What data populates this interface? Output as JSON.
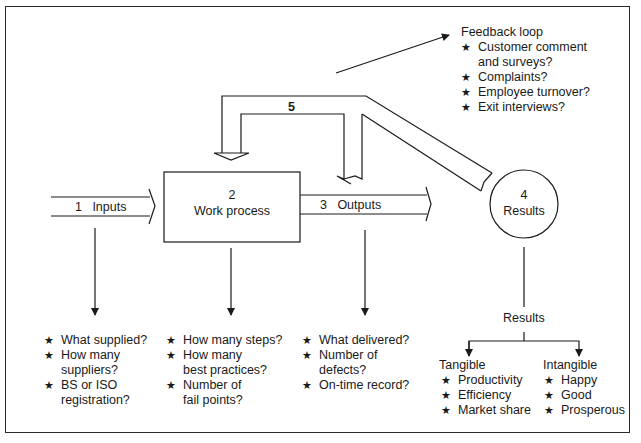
{
  "diagram": {
    "type": "process-flow",
    "stroke_color": "#1a1a1a",
    "nodes": {
      "inputs": {
        "number": "1",
        "label": "Inputs"
      },
      "work_process": {
        "number": "2",
        "label": "Work process"
      },
      "outputs": {
        "number": "3",
        "label": "Outputs"
      },
      "results": {
        "number": "4",
        "label": "Results"
      },
      "feedback_arrow": {
        "number": "5"
      }
    },
    "feedback_loop": {
      "title": "Feedback loop",
      "items": [
        "Customer comment\nand surveys?",
        "Complaints?",
        "Employee turnover?",
        "Exit interviews?"
      ]
    },
    "inputs_questions": [
      "What supplied?",
      "How many\nsuppliers?",
      "BS or ISO\nregistration?"
    ],
    "work_process_questions": [
      "How many steps?",
      "How many\nbest practices?",
      "Number of\nfail points?"
    ],
    "outputs_questions": [
      "What delivered?",
      "Number of\ndefects?",
      "On-time record?"
    ],
    "results_breakdown": {
      "title": "Results",
      "tangible": {
        "title": "Tangible",
        "items": [
          "Productivity",
          "Efficiency",
          "Market share"
        ]
      },
      "intangible": {
        "title": "Intangible",
        "items": [
          "Happy",
          "Good",
          "Prosperous"
        ]
      }
    },
    "bullet_glyph": "★"
  }
}
